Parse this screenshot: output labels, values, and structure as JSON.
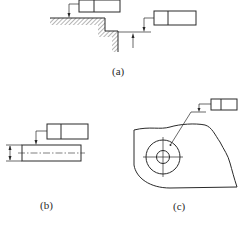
{
  "figure": {
    "panels": [
      {
        "id": "a",
        "label": "(a)",
        "description": "Stepped surface with hatched section; feature control frames referencing a surface and a step line"
      },
      {
        "id": "b",
        "label": "(b)",
        "description": "Rectangular part with centerline and dimension arrows; feature control frame pointing to the top surface"
      },
      {
        "id": "c",
        "label": "(c)",
        "description": "Broken-out part outline with concentric circles and crosshair centerlines; feature control frame with leader to the bore"
      }
    ],
    "feature_control_frames": [
      {
        "panel": "a",
        "index": 1,
        "cells": [
          "",
          ""
        ]
      },
      {
        "panel": "a",
        "index": 2,
        "cells": [
          "",
          ""
        ]
      },
      {
        "panel": "b",
        "index": 1,
        "cells": [
          "",
          ""
        ]
      },
      {
        "panel": "c",
        "index": 1,
        "cells": [
          "",
          ""
        ]
      }
    ],
    "colors": {
      "line": "#2a2a2a",
      "background": "#ffffff"
    }
  }
}
